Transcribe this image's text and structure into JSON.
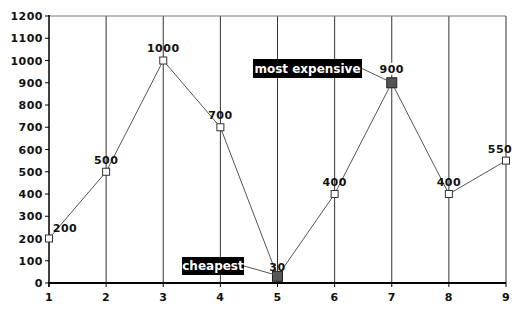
{
  "chart_data": {
    "type": "line",
    "title": "",
    "xlabel": "",
    "ylabel": "",
    "x": [
      1,
      2,
      3,
      4,
      5,
      6,
      7,
      8,
      9
    ],
    "categories": [
      "1",
      "2",
      "3",
      "4",
      "5",
      "6",
      "7",
      "8",
      "9"
    ],
    "series": [
      {
        "name": "Price",
        "values": [
          200,
          500,
          1000,
          700,
          30,
          400,
          900,
          400,
          550
        ]
      }
    ],
    "data_labels": [
      "200",
      "500",
      "1000",
      "700",
      "30",
      "400",
      "900",
      "400",
      "550"
    ],
    "ylim": [
      0,
      1200
    ],
    "yticks": [
      0,
      100,
      200,
      300,
      400,
      500,
      600,
      700,
      800,
      900,
      1000,
      1100,
      1200
    ],
    "ytick_labels": [
      "0",
      "100",
      "200",
      "300",
      "400",
      "500",
      "600",
      "700",
      "800",
      "900",
      "1000",
      "1100",
      "1200"
    ],
    "grid": {
      "vertical": true,
      "horizontal": false
    },
    "legend": null,
    "annotations": [
      {
        "text": "cheapest",
        "x": 5,
        "y": 30
      },
      {
        "text": "most expensive",
        "x": 7,
        "y": 900
      }
    ],
    "highlighted_points": [
      5,
      7
    ]
  },
  "colors": {
    "line": "#555555",
    "axis": "#000000",
    "grid": "#333333",
    "marker_fill": "#ffffff",
    "marker_stroke": "#333333",
    "highlight_fill": "#555555",
    "callout_bg": "#000000",
    "callout_text": "#ffffff"
  }
}
